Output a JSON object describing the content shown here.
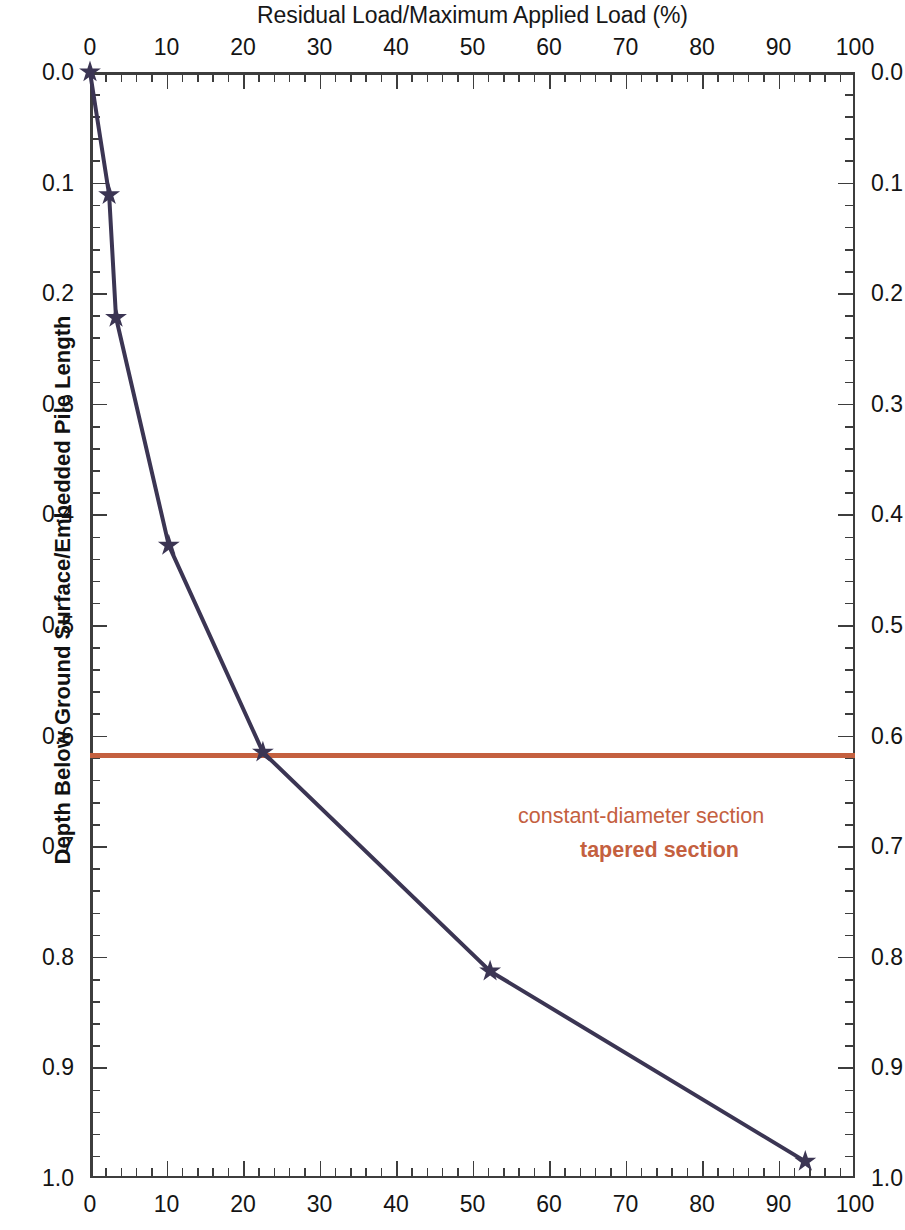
{
  "chart_data": {
    "type": "line",
    "title": "Residual Load/Maximum Applied Load (%)",
    "xlabel": "Residual Load/Maximum Applied Load (%)",
    "ylabel": "Depth Below Ground Surface/Embedded Pile Length",
    "xlim": [
      0,
      100
    ],
    "ylim": [
      0.0,
      1.0
    ],
    "y_axis_inverted": true,
    "grid": false,
    "legend": "none",
    "x_ticks": [
      0,
      10,
      20,
      30,
      40,
      50,
      60,
      70,
      80,
      90,
      100
    ],
    "x_tick_labels": [
      "0",
      "10",
      "20",
      "30",
      "40",
      "50",
      "60",
      "70",
      "80",
      "90",
      "100"
    ],
    "x_minor_tick_interval": 2,
    "y_ticks": [
      0.0,
      0.1,
      0.2,
      0.3,
      0.4,
      0.5,
      0.6,
      0.7,
      0.8,
      0.9,
      1.0
    ],
    "y_tick_labels": [
      "0.0",
      "0.1",
      "0.2",
      "0.3",
      "0.4",
      "0.5",
      "0.6",
      "0.7",
      "0.8",
      "0.9",
      "1.0"
    ],
    "y_minor_tick_interval": 0.02,
    "x_axis_top": true,
    "x_axis_bottom": true,
    "y_axis_left": true,
    "y_axis_right": true,
    "series": [
      {
        "name": "residual-load-profile",
        "marker": "star",
        "color": "#3b3553",
        "line_width": 4,
        "x": [
          0,
          2.5,
          3.4,
          10.3,
          22.6,
          52.3,
          93.5
        ],
        "y": [
          0.0,
          0.111,
          0.222,
          0.428,
          0.615,
          0.813,
          0.985
        ]
      }
    ],
    "annotations": [
      {
        "name": "boundary-line",
        "type": "hline",
        "y": 0.618,
        "color": "#C4603F",
        "line_width": 5
      },
      {
        "name": "upper-region-label",
        "type": "text",
        "text": "constant-diameter section",
        "color": "#C4603F",
        "bold": false,
        "x": 44.2,
        "y": 0.6
      },
      {
        "name": "lower-region-label",
        "type": "text",
        "text": "tapered section",
        "color": "#C4603F",
        "bold": true,
        "x": 52.3,
        "y": 0.631
      }
    ]
  },
  "figure": {
    "top_axis_title": "Residual Load/Maximum Applied Load (%)",
    "left_axis_title": "Depth Below Ground Surface/Embedded Pile Length",
    "background_color": "#ffffff",
    "axis_color": "#3d3d3d",
    "series_color": "#3b3553",
    "accent_color": "#C4603F"
  }
}
